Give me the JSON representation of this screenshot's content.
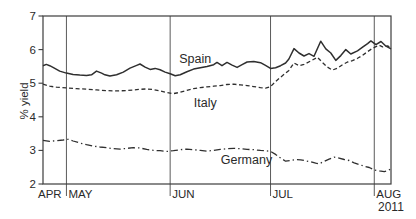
{
  "figure": {
    "background": "#ffffff",
    "ink_color": "#2f2f2f",
    "frame_color": "#3d3d3d",
    "grid_color": "#5a5a5a"
  },
  "chart_data": {
    "type": "line",
    "title": "",
    "xlabel": "",
    "ylabel": "% yield",
    "ylim": [
      2,
      7
    ],
    "yticks": [
      2,
      3,
      4,
      5,
      6,
      7
    ],
    "xlim": [
      0,
      104
    ],
    "x_unit": "days from late April 2011 to early August 2011",
    "grid": "vertical month separators only",
    "legend": "inline series labels",
    "month_gridlines_days": [
      7,
      38,
      68,
      99
    ],
    "month_labels": [
      {
        "label": "APR",
        "day": 0
      },
      {
        "label": "MAY",
        "day": 7
      },
      {
        "label": "JUN",
        "day": 38
      },
      {
        "label": "JUL",
        "day": 68
      },
      {
        "label": "AUG",
        "day": 99
      }
    ],
    "year_label": "2011",
    "series": [
      {
        "name": "Spain",
        "style": "solid",
        "width": 1.5,
        "label_at": [
          45.5,
          5.72
        ],
        "points": [
          [
            0,
            5.52
          ],
          [
            1,
            5.56
          ],
          [
            2,
            5.52
          ],
          [
            3,
            5.47
          ],
          [
            5,
            5.36
          ],
          [
            7,
            5.3
          ],
          [
            9,
            5.26
          ],
          [
            11,
            5.24
          ],
          [
            13,
            5.23
          ],
          [
            14.5,
            5.25
          ],
          [
            16,
            5.36
          ],
          [
            17.5,
            5.3
          ],
          [
            18.5,
            5.25
          ],
          [
            20,
            5.21
          ],
          [
            22,
            5.25
          ],
          [
            24,
            5.33
          ],
          [
            26,
            5.45
          ],
          [
            28,
            5.53
          ],
          [
            29,
            5.57
          ],
          [
            30.5,
            5.48
          ],
          [
            32,
            5.41
          ],
          [
            33.5,
            5.44
          ],
          [
            35,
            5.4
          ],
          [
            36.5,
            5.33
          ],
          [
            38,
            5.28
          ],
          [
            39.5,
            5.22
          ],
          [
            41,
            5.25
          ],
          [
            43,
            5.34
          ],
          [
            45,
            5.42
          ],
          [
            47,
            5.46
          ],
          [
            49,
            5.5
          ],
          [
            51,
            5.55
          ],
          [
            52,
            5.62
          ],
          [
            53.5,
            5.52
          ],
          [
            55,
            5.62
          ],
          [
            56.5,
            5.54
          ],
          [
            58,
            5.47
          ],
          [
            59.5,
            5.55
          ],
          [
            61,
            5.63
          ],
          [
            63,
            5.65
          ],
          [
            65,
            5.61
          ],
          [
            66.5,
            5.53
          ],
          [
            68,
            5.44
          ],
          [
            69.5,
            5.46
          ],
          [
            71,
            5.52
          ],
          [
            72.5,
            5.6
          ],
          [
            73.5,
            5.72
          ],
          [
            75,
            6.03
          ],
          [
            76.5,
            5.9
          ],
          [
            78,
            5.81
          ],
          [
            79.5,
            5.88
          ],
          [
            81,
            5.8
          ],
          [
            83,
            6.25
          ],
          [
            84.5,
            6.02
          ],
          [
            86,
            5.9
          ],
          [
            87.5,
            5.68
          ],
          [
            89,
            5.82
          ],
          [
            90.5,
            6.0
          ],
          [
            92,
            5.87
          ],
          [
            94,
            5.96
          ],
          [
            95.5,
            6.07
          ],
          [
            97,
            6.18
          ],
          [
            98,
            6.26
          ],
          [
            99.5,
            6.15
          ],
          [
            101,
            6.24
          ],
          [
            102.5,
            6.1
          ],
          [
            104,
            6.02
          ]
        ]
      },
      {
        "name": "Italy",
        "style": "dashed",
        "width": 1.3,
        "label_at": [
          48.5,
          4.4
        ],
        "points": [
          [
            0,
            4.97
          ],
          [
            2,
            4.91
          ],
          [
            4,
            4.88
          ],
          [
            7,
            4.86
          ],
          [
            10,
            4.84
          ],
          [
            13,
            4.82
          ],
          [
            16,
            4.8
          ],
          [
            19,
            4.78
          ],
          [
            22,
            4.77
          ],
          [
            25,
            4.78
          ],
          [
            28,
            4.81
          ],
          [
            31,
            4.83
          ],
          [
            33,
            4.81
          ],
          [
            35,
            4.77
          ],
          [
            37,
            4.72
          ],
          [
            39,
            4.69
          ],
          [
            41,
            4.73
          ],
          [
            43,
            4.79
          ],
          [
            45,
            4.84
          ],
          [
            47,
            4.87
          ],
          [
            49,
            4.89
          ],
          [
            51,
            4.91
          ],
          [
            53,
            4.93
          ],
          [
            55,
            4.96
          ],
          [
            57,
            4.97
          ],
          [
            59,
            4.95
          ],
          [
            61,
            4.93
          ],
          [
            63,
            4.9
          ],
          [
            65,
            4.87
          ],
          [
            66.5,
            4.85
          ],
          [
            68,
            4.9
          ],
          [
            69.5,
            5.05
          ],
          [
            71,
            5.18
          ],
          [
            72.5,
            5.3
          ],
          [
            73.5,
            5.38
          ],
          [
            75,
            5.6
          ],
          [
            76.5,
            5.52
          ],
          [
            78,
            5.56
          ],
          [
            80,
            5.66
          ],
          [
            82,
            5.77
          ],
          [
            83.5,
            5.62
          ],
          [
            85,
            5.48
          ],
          [
            86.5,
            5.39
          ],
          [
            88,
            5.45
          ],
          [
            89.5,
            5.55
          ],
          [
            91,
            5.63
          ],
          [
            92.5,
            5.67
          ],
          [
            94,
            5.74
          ],
          [
            95.5,
            5.83
          ],
          [
            97,
            5.94
          ],
          [
            98.5,
            6.04
          ],
          [
            99.5,
            6.09
          ],
          [
            100.5,
            6.13
          ],
          [
            101.5,
            6.08
          ],
          [
            103,
            6.11
          ],
          [
            104,
            6.04
          ]
        ]
      },
      {
        "name": "Germany",
        "style": "dashdot",
        "width": 1.3,
        "label_at": [
          60.8,
          2.72
        ],
        "points": [
          [
            0,
            3.3
          ],
          [
            2,
            3.27
          ],
          [
            4,
            3.29
          ],
          [
            6,
            3.31
          ],
          [
            7.5,
            3.33
          ],
          [
            9,
            3.28
          ],
          [
            11,
            3.22
          ],
          [
            13,
            3.17
          ],
          [
            15,
            3.13
          ],
          [
            17,
            3.1
          ],
          [
            19,
            3.08
          ],
          [
            21,
            3.05
          ],
          [
            23,
            3.04
          ],
          [
            25,
            3.06
          ],
          [
            27,
            3.08
          ],
          [
            29,
            3.07
          ],
          [
            31,
            3.03
          ],
          [
            33,
            3.0
          ],
          [
            35,
            2.99
          ],
          [
            37,
            2.97
          ],
          [
            39,
            2.99
          ],
          [
            41,
            3.02
          ],
          [
            43,
            3.04
          ],
          [
            45,
            3.02
          ],
          [
            47,
            3.0
          ],
          [
            49,
            2.98
          ],
          [
            51,
            3.0
          ],
          [
            53,
            3.03
          ],
          [
            55,
            3.05
          ],
          [
            57,
            3.06
          ],
          [
            59,
            3.05
          ],
          [
            61,
            3.03
          ],
          [
            63,
            3.02
          ],
          [
            65,
            3.0
          ],
          [
            66.5,
            2.99
          ],
          [
            68,
            2.97
          ],
          [
            69.5,
            2.88
          ],
          [
            71,
            2.77
          ],
          [
            72.5,
            2.68
          ],
          [
            74,
            2.7
          ],
          [
            75.5,
            2.73
          ],
          [
            77,
            2.72
          ],
          [
            78.5,
            2.69
          ],
          [
            80,
            2.66
          ],
          [
            81.5,
            2.62
          ],
          [
            82.5,
            2.6
          ],
          [
            84,
            2.67
          ],
          [
            85.5,
            2.74
          ],
          [
            87,
            2.8
          ],
          [
            88.5,
            2.77
          ],
          [
            90,
            2.73
          ],
          [
            91.5,
            2.7
          ],
          [
            93,
            2.63
          ],
          [
            94.5,
            2.58
          ],
          [
            96,
            2.53
          ],
          [
            97.5,
            2.49
          ],
          [
            99,
            2.42
          ],
          [
            100.5,
            2.39
          ],
          [
            102,
            2.37
          ],
          [
            103,
            2.4
          ],
          [
            104,
            2.45
          ]
        ]
      }
    ]
  }
}
